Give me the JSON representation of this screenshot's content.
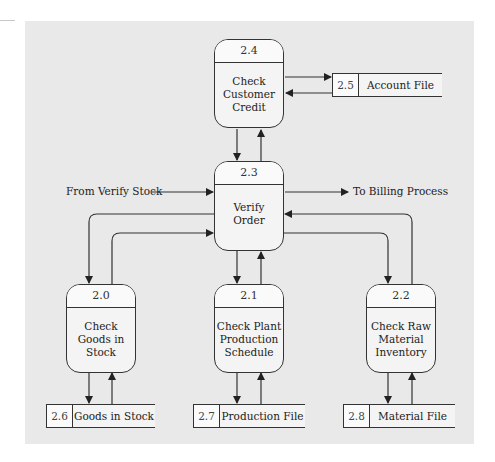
{
  "diagram": {
    "type": "data-flow-diagram",
    "processes": [
      {
        "id": "2.4",
        "lines": [
          "Check",
          "Customer",
          "Credit"
        ]
      },
      {
        "id": "2.3",
        "lines": [
          "Verify",
          "Order"
        ]
      },
      {
        "id": "2.0",
        "lines": [
          "Check",
          "Goods in",
          "Stock"
        ]
      },
      {
        "id": "2.1",
        "lines": [
          "Check Plant",
          "Production",
          "Schedule"
        ]
      },
      {
        "id": "2.2",
        "lines": [
          "Check Raw",
          "Material",
          "Inventory"
        ]
      }
    ],
    "stores": [
      {
        "id": "2.5",
        "name": "Account File"
      },
      {
        "id": "2.6",
        "name": "Goods in Stock"
      },
      {
        "id": "2.7",
        "name": "Production File"
      },
      {
        "id": "2.8",
        "name": "Material File"
      }
    ],
    "external_flows": {
      "incoming": "From Verify Stock",
      "outgoing": "To Billing Process"
    },
    "colors": {
      "panel": "#e9e9e9",
      "line": "#333333",
      "box_fill": "#f4f4f4"
    }
  }
}
